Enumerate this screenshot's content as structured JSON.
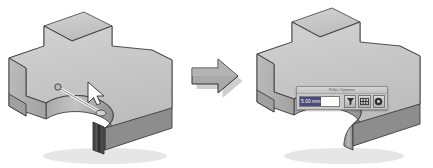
{
  "figure": {
    "caption_fragments": {
      "top_left": "",
      "top_right": ""
    },
    "before": {
      "name": "3d-part-before-fillet",
      "description": "Isometric shaded CAD solid — cross/plus shaped block with concave cylindrical cutout, one vertical edge highlighted for selection",
      "selected_edge_label": "selected-edge",
      "pointer_label": "cursor-arrow"
    },
    "transition": {
      "name": "transform-arrow",
      "direction": "right",
      "label": ""
    },
    "after": {
      "name": "3d-part-after-fillet",
      "description": "Same isometric CAD solid with the selected edge filleted (rounded)"
    }
  },
  "toolbar": {
    "title": "Fillet Options",
    "radius_field": {
      "name": "radius-input",
      "value": "5.00 mm",
      "placeholder": "Radius"
    },
    "buttons": [
      {
        "name": "apply-fillet-button",
        "icon": "funnel-icon",
        "label": ""
      },
      {
        "name": "options-grid-button",
        "icon": "grid-icon",
        "label": ""
      },
      {
        "name": "confirm-button",
        "icon": "circle-check-icon",
        "label": ""
      }
    ]
  },
  "colors": {
    "face_top": "#c6c6c6",
    "face_left": "#b0b0b0",
    "face_right": "#909090",
    "face_dark": "#6e6e6e",
    "outline": "#3c3c3c",
    "arrow_fill": "#a8a8a8",
    "arrow_outline": "#3c3c3c",
    "shadow": "#d4d4d4",
    "background": "#ffffff",
    "toolbar_bg": "#c8c8c8",
    "field_highlight": "#4a4a78"
  }
}
